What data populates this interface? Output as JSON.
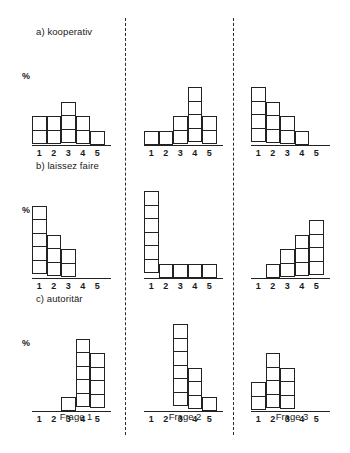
{
  "figure": {
    "axis_caption": "%",
    "row_labels": [
      {
        "id": "a",
        "text": "a) kooperativ"
      },
      {
        "id": "b",
        "text": "b) laissez faire"
      },
      {
        "id": "c",
        "text": "c) autoritär"
      }
    ],
    "column_captions": [
      "Frage 1",
      "Frage 2",
      "Frage 3"
    ],
    "separators": 2,
    "colors": {
      "ink": "#222222",
      "background": "#ffffff"
    }
  },
  "chart_data": [
    {
      "type": "bar",
      "title": "a) kooperativ",
      "subtitle": "Frage 1",
      "row": "a",
      "column": "Frage 1",
      "categories": [
        "1",
        "2",
        "3",
        "4",
        "5"
      ],
      "values": [
        2,
        2,
        3,
        2,
        1
      ],
      "xlabel": "",
      "ylabel": "%",
      "ylim": [
        0,
        6
      ],
      "grid": false,
      "legend": false,
      "note": "values are counts of stacked unit squares"
    },
    {
      "type": "bar",
      "title": "a) kooperativ",
      "subtitle": "Frage 2",
      "row": "a",
      "column": "Frage 2",
      "categories": [
        "1",
        "2",
        "3",
        "4",
        "5"
      ],
      "values": [
        1,
        1,
        2,
        4,
        2
      ],
      "xlabel": "",
      "ylabel": "%",
      "ylim": [
        0,
        6
      ],
      "grid": false,
      "legend": false
    },
    {
      "type": "bar",
      "title": "a) kooperativ",
      "subtitle": "Frage 3",
      "row": "a",
      "column": "Frage 3",
      "categories": [
        "1",
        "2",
        "3",
        "4",
        "5"
      ],
      "values": [
        4,
        3,
        2,
        1,
        0
      ],
      "xlabel": "",
      "ylabel": "%",
      "ylim": [
        0,
        6
      ],
      "grid": false,
      "legend": false
    },
    {
      "type": "bar",
      "title": "b) laissez faire",
      "subtitle": "Frage 1",
      "row": "b",
      "column": "Frage 1",
      "categories": [
        "1",
        "2",
        "3",
        "4",
        "5"
      ],
      "values": [
        5,
        3,
        2,
        0,
        0
      ],
      "xlabel": "",
      "ylabel": "%",
      "ylim": [
        0,
        6
      ],
      "grid": false,
      "legend": false
    },
    {
      "type": "bar",
      "title": "b) laissez faire",
      "subtitle": "Frage 2",
      "row": "b",
      "column": "Frage 2",
      "categories": [
        "1",
        "2",
        "3",
        "4",
        "5"
      ],
      "values": [
        6,
        1,
        1,
        1,
        1
      ],
      "xlabel": "",
      "ylabel": "%",
      "ylim": [
        0,
        6
      ],
      "grid": false,
      "legend": false
    },
    {
      "type": "bar",
      "title": "b) laissez faire",
      "subtitle": "Frage 3",
      "row": "b",
      "column": "Frage 3",
      "categories": [
        "1",
        "2",
        "3",
        "4",
        "5"
      ],
      "values": [
        0,
        1,
        2,
        3,
        4
      ],
      "xlabel": "",
      "ylabel": "%",
      "ylim": [
        0,
        6
      ],
      "grid": false,
      "legend": false
    },
    {
      "type": "bar",
      "title": "c) autoritär",
      "subtitle": "Frage 1",
      "row": "c",
      "column": "Frage 1",
      "categories": [
        "1",
        "2",
        "3",
        "4",
        "5"
      ],
      "values": [
        0,
        0,
        1,
        5,
        4
      ],
      "xlabel": "",
      "ylabel": "%",
      "ylim": [
        0,
        6
      ],
      "grid": false,
      "legend": false
    },
    {
      "type": "bar",
      "title": "c) autoritär",
      "subtitle": "Frage 2",
      "row": "c",
      "column": "Frage 2",
      "categories": [
        "1",
        "2",
        "3",
        "4",
        "5"
      ],
      "values": [
        0,
        0,
        6,
        3,
        1
      ],
      "xlabel": "",
      "ylabel": "%",
      "ylim": [
        0,
        6
      ],
      "grid": false,
      "legend": false
    },
    {
      "type": "bar",
      "title": "c) autoritär",
      "subtitle": "Frage 3",
      "row": "c",
      "column": "Frage 3",
      "categories": [
        "1",
        "2",
        "3",
        "4",
        "5"
      ],
      "values": [
        2,
        4,
        3,
        0,
        0
      ],
      "xlabel": "",
      "ylabel": "%",
      "ylim": [
        0,
        6
      ],
      "grid": false,
      "legend": false
    }
  ]
}
